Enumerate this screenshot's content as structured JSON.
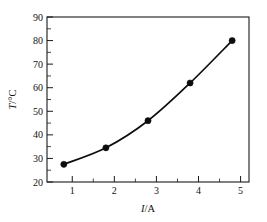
{
  "chart_data": {
    "type": "line",
    "title": "",
    "subtitle": "",
    "xlabel": "I/A",
    "xlabel_italic_part": "I",
    "xlabel_rest": "/A",
    "ylabel": "T/°C",
    "ylabel_italic_part": "T",
    "ylabel_rest": "/°C",
    "x": [
      1,
      2,
      3,
      4,
      5
    ],
    "values": [
      27.5,
      34.5,
      46,
      62,
      80
    ],
    "series": [
      {
        "name": "temperature",
        "values": [
          27.5,
          34.5,
          46,
          62,
          80
        ],
        "marker": "filled-circle",
        "color": "#0d0d0d"
      }
    ],
    "xlim": [
      0.6,
      5.4
    ],
    "ylim": [
      20,
      90
    ],
    "xticks": [
      1,
      2,
      3,
      4,
      5
    ],
    "xtick_labels": [
      "1",
      "2",
      "3",
      "4",
      "5"
    ],
    "yticks": [
      20,
      30,
      40,
      50,
      60,
      70,
      80,
      90
    ],
    "ytick_labels": [
      "20",
      "30",
      "40",
      "50",
      "60",
      "70",
      "80",
      "90"
    ],
    "x_minor_ticks": [
      1.5,
      2.5,
      3.5,
      4.5
    ],
    "y_minor_ticks": [
      25,
      35,
      45,
      55,
      65,
      75,
      85
    ],
    "grid": false,
    "legend": null,
    "legend_position": "none",
    "annotations": [],
    "background_color": "#ffffff",
    "axis_color": "#1a1a1a",
    "tick_direction": "in"
  }
}
